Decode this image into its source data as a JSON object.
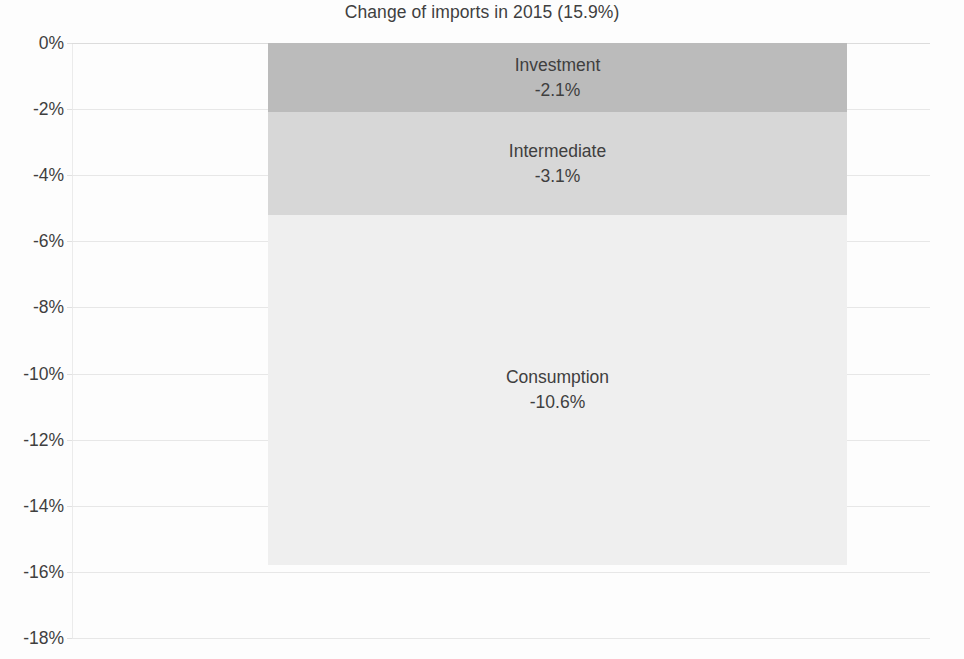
{
  "chart_data": {
    "type": "bar",
    "subtype": "stacked-bar-single-category",
    "title": "Change of imports in 2015 (15.9%)",
    "xlabel": "",
    "ylabel": "",
    "ylim": [
      -18,
      0
    ],
    "y_tick_labels": [
      "0%",
      "-2%",
      "-4%",
      "-6%",
      "-8%",
      "-10%",
      "-12%",
      "-14%",
      "-16%",
      "-18%"
    ],
    "y_tick_values": [
      0,
      -2,
      -4,
      -6,
      -8,
      -10,
      -12,
      -14,
      -16,
      -18
    ],
    "categories": [
      "Change of imports in 2015"
    ],
    "grid": true,
    "legend": "none (series labelled in-place on each segment)",
    "series": [
      {
        "name": "Investment",
        "value": -2.1,
        "value_label": "-2.1%",
        "color": "#bdbdbd",
        "stack_from": 0,
        "stack_to": -2.1
      },
      {
        "name": "Intermediate",
        "value": -3.1,
        "value_label": "-3.1%",
        "color": "#d9d9d9",
        "stack_from": -2.1,
        "stack_to": -5.2
      },
      {
        "name": "Consumption",
        "value": -10.6,
        "value_label": "-10.6%",
        "color": "#f1f1f1",
        "stack_from": -5.2,
        "stack_to": -15.8
      }
    ],
    "total_label": "15.9%",
    "annotations": []
  },
  "colors": {
    "text": "#3f3f3f",
    "background": "#ffffff",
    "gridline": "#e9e9e9",
    "investment": "#bdbdbd",
    "intermediate": "#d9d9d9",
    "consumption": "#f1f1f1"
  }
}
